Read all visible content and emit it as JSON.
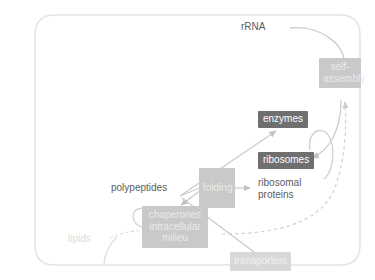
{
  "diagram": {
    "boundary": {
      "name": "cell-membrane",
      "shape": "rounded-rectangle",
      "stroke": "#e2e2e2"
    },
    "palette": {
      "chip_dark_bg": "#6f6f6f",
      "chip_dark_text": "#ffffff",
      "chip_mid_bg": "#c9c9c9",
      "chip_mid_text": "#eaeaea",
      "chip_faint_bg": "#d8d8d8",
      "text_dark": "#5c5c5c",
      "text_pale": "#dcdcdc",
      "arrow_solid": "#c6c6c6",
      "arrow_dashed": "#cfcfcf"
    },
    "nodes": [
      {
        "id": "rrna",
        "label": "rRNA",
        "style": "plain-dark"
      },
      {
        "id": "self_assembly",
        "label": "self-\nassembly",
        "style": "box-mid"
      },
      {
        "id": "enzymes",
        "label": "enzymes",
        "style": "box-dark"
      },
      {
        "id": "ribosomes",
        "label": "ribosomes",
        "style": "box-dark"
      },
      {
        "id": "ribosomal_proteins",
        "label": "ribosomal\nproteins",
        "style": "plain-dark"
      },
      {
        "id": "folding",
        "label": "folding",
        "style": "box-mid"
      },
      {
        "id": "polypeptides",
        "label": "polypeptides",
        "style": "plain-dark"
      },
      {
        "id": "chaperones",
        "label": "chaperones\nintracellular\nmilieu",
        "style": "box-mid"
      },
      {
        "id": "lipids",
        "label": "lipids",
        "style": "plain-pale"
      },
      {
        "id": "transporters",
        "label": "transporters",
        "style": "box-faint"
      }
    ],
    "edges": [
      {
        "from": "rrna",
        "to": "self_assembly",
        "kind": "solid-curve"
      },
      {
        "from": "self_assembly",
        "to": "ribosomes",
        "kind": "solid-curve"
      },
      {
        "from": "self_assembly",
        "to": "ribosomal_proteins",
        "kind": "solid-curve"
      },
      {
        "from": "folding",
        "to": "ribosomal_proteins",
        "kind": "solid-arrow"
      },
      {
        "from": "folding",
        "to": "chaperones",
        "kind": "solid-arrow"
      },
      {
        "from": "polypeptides",
        "to": "chaperones",
        "kind": "loop-arrow"
      },
      {
        "from": "transporters",
        "to": "folding",
        "kind": "solid-line"
      },
      {
        "from": "chaperones",
        "to": "self_assembly",
        "kind": "dashed-arrow"
      },
      {
        "from": "lipids",
        "to": "chaperones",
        "kind": "dashed-curve"
      },
      {
        "from": "chaperones",
        "to": "enzymes",
        "kind": "solid-arrow"
      }
    ]
  }
}
